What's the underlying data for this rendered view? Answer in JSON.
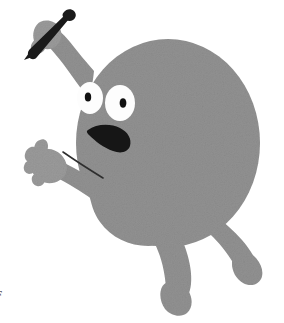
{
  "illustration": {
    "title": "Anxious gray blob character running with a pen",
    "background_color": "#ffffff",
    "body_color": "#919191",
    "body_shade_color": "#8a8a8a",
    "ink_color": "#1a1a1a",
    "eye_white_color": "#fdfdfd",
    "pupil_color": "#111111",
    "character_name": "gray-blob-character",
    "mood": "surprised",
    "parts": {
      "body_label": "body",
      "head_label": "head",
      "left_eye_label": "left eye",
      "right_eye_label": "right eye",
      "left_pupil_label": "left pupil",
      "right_pupil_label": "right pupil",
      "mouth_label": "open mouth",
      "raised_arm_label": "raised arm",
      "pen_hand_label": "pen hand",
      "pen_label": "pen",
      "pen_tip_label": "pen tip",
      "outstretched_arm_label": "outstretched arm",
      "open_hand_label": "open hand",
      "arm_crease_label": "arm crease line",
      "front_leg_label": "front leg",
      "back_leg_label": "back leg",
      "front_foot_label": "front foot",
      "back_foot_label": "back foot"
    }
  },
  "corner_mark": {
    "text": "F",
    "description": "cropped glyph fragment at bottom-left edge"
  }
}
